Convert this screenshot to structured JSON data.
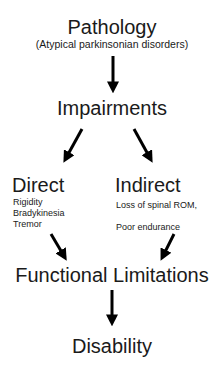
{
  "diagram": {
    "pathology": {
      "title": "Pathology",
      "subtitle": "(Atypical parkinsonian disorders)"
    },
    "impairments": {
      "title": "Impairments"
    },
    "direct": {
      "title": "Direct",
      "items": [
        "Rigidity",
        "Bradykinesia",
        "Tremor"
      ]
    },
    "indirect": {
      "title": "Indirect",
      "items": [
        "Loss of spinal ROM,",
        "",
        "Poor endurance"
      ]
    },
    "functional_limitations": {
      "title": "Functional Limitations"
    },
    "disability": {
      "title": "Disability"
    },
    "edges": [
      {
        "from": "pathology",
        "to": "impairments"
      },
      {
        "from": "impairments",
        "to": "direct"
      },
      {
        "from": "impairments",
        "to": "indirect"
      },
      {
        "from": "direct",
        "to": "functional_limitations"
      },
      {
        "from": "indirect",
        "to": "functional_limitations"
      },
      {
        "from": "functional_limitations",
        "to": "disability"
      }
    ],
    "colors": {
      "text": "#1a1a1a",
      "arrow": "#000000",
      "background": "#ffffff"
    }
  }
}
